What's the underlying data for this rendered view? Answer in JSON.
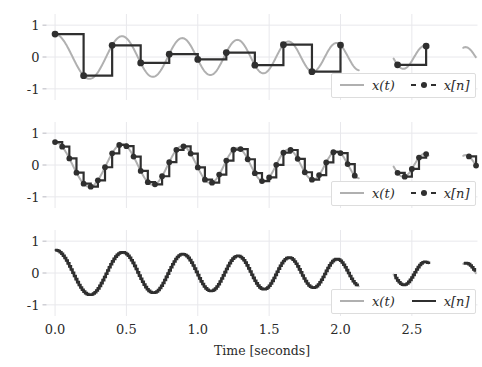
{
  "figure": {
    "width": 482,
    "height": 367,
    "background": "#ffffff",
    "axis_label": "Time [seconds]"
  },
  "style": {
    "continuous_color": "#b0b0b0",
    "sampled_color": "#2f2f2f",
    "grid_color": "#e8e8ec",
    "tick_color": "#b8b8c0",
    "text_color": "#2b2b2b",
    "legend_border": "#dddddd",
    "legend_face": "#ffffff"
  },
  "legend": {
    "continuous_label": "x(t)",
    "sampled_label": "x[n]"
  },
  "chart_data": {
    "type": "line",
    "title": "",
    "xlabel": "Time [seconds]",
    "ylabel": "",
    "xlim": [
      -0.06,
      2.96
    ],
    "ylim": [
      -1.35,
      1.35
    ],
    "xticks": [
      0.0,
      0.5,
      1.0,
      1.5,
      2.0,
      2.5
    ],
    "xticklabels": [
      "0.0",
      "0.5",
      "1.0",
      "1.5",
      "2.0",
      "2.5"
    ],
    "yticks": [
      -1,
      0,
      1
    ],
    "yticklabels": [
      "-1",
      "0",
      "1"
    ],
    "grid": true,
    "legend_position": "lower right",
    "signal_description": "Decaying linear chirp x(t) = A(t)*cos(2*pi*phi(t)) sampled at three rates; staircase (zero-order hold) drawn for x[n].",
    "signal_model": {
      "amplitude_start": 0.72,
      "amplitude_end": 0.3,
      "freq_start_hz": 2.0,
      "freq_end_hz": 3.6,
      "phase_offset_deg": 0,
      "t_start": 0.0,
      "t_end": 2.95,
      "gaps": [
        [
          2.13,
          2.37
        ],
        [
          2.62,
          2.86
        ]
      ]
    },
    "panels": [
      {
        "index": 0,
        "name": "undersampled",
        "sample_rate_hz": 5,
        "sample_period_s": 0.2,
        "legend": {
          "continuous": "x(t)",
          "sampled": "x[n]"
        },
        "sampled_linestyle": "dash-dot-marker",
        "samples_t": [
          0.0,
          0.2,
          0.4,
          0.6,
          0.8,
          1.0,
          1.2,
          1.4,
          1.6,
          1.8,
          2.0,
          2.4,
          2.6
        ],
        "samples_y": [
          0.72,
          -0.2,
          0.36,
          0.34,
          -0.27,
          0.63,
          -0.36,
          0.18,
          0.11,
          -0.49,
          0.4,
          0.01,
          0.02
        ]
      },
      {
        "index": 1,
        "name": "near-nyquist",
        "sample_rate_hz": 20,
        "sample_period_s": 0.05,
        "legend": {
          "continuous": "x(t)",
          "sampled": "x[n]"
        },
        "sampled_linestyle": "dash-dot-marker"
      },
      {
        "index": 2,
        "name": "oversampled",
        "sample_rate_hz": 90,
        "sample_period_s": 0.0111,
        "legend": {
          "continuous": "x(t)",
          "sampled": "x[n]"
        },
        "sampled_linestyle": "solid"
      }
    ]
  }
}
